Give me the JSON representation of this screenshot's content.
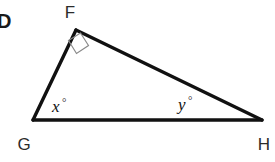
{
  "figure": {
    "item_letter": "D",
    "background_color": "#ffffff",
    "line_color": "#111111",
    "mark_color": "#8a8a8a",
    "label_color": "#2b2b2b",
    "vertices": {
      "F": {
        "label": "F",
        "x": 76,
        "y": 30,
        "label_x": 70,
        "label_y": 18
      },
      "G": {
        "label": "G",
        "x": 33,
        "y": 120,
        "label_x": 24,
        "label_y": 150
      },
      "H": {
        "label": "H",
        "x": 262,
        "y": 120,
        "label_x": 262,
        "label_y": 150
      }
    },
    "angles": [
      {
        "name": "angle-x",
        "value": "x",
        "degree_symbol": "°",
        "at_vertex": "G",
        "x": 52,
        "y": 112
      },
      {
        "name": "angle-y",
        "value": "y",
        "degree_symbol": "°",
        "at_vertex": "H",
        "x": 178,
        "y": 110
      }
    ],
    "right_angle": {
      "at_vertex": "F",
      "label": "right-angle-mark",
      "points": "68.5,40.5 80.5,33.0 88.5,45.5 76.5,53.5"
    },
    "sides": {
      "FG": "M 76 30 L 33 120",
      "GH": "M 33 120 L 262 120",
      "FH": "M 76 30 L 262 120"
    }
  }
}
